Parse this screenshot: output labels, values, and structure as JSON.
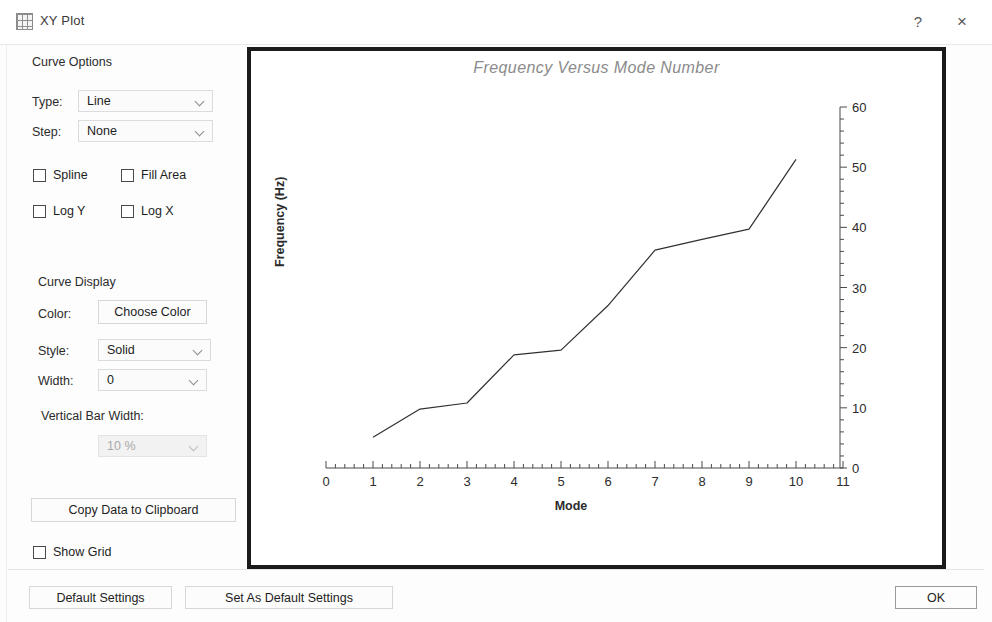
{
  "window": {
    "title": "XY Plot",
    "icon": "xy-plot-icon",
    "help_label": "?",
    "close_label": "×"
  },
  "curve_options": {
    "group_label": "Curve Options",
    "type_label": "Type:",
    "type_value": "Line",
    "type_options": [
      "Line",
      "Scatter",
      "Bar"
    ],
    "step_label": "Step:",
    "step_value": "None",
    "step_options": [
      "None",
      "Left",
      "Center",
      "Right"
    ],
    "spline_label": "Spline",
    "spline_checked": false,
    "fill_area_label": "Fill Area",
    "fill_area_checked": false,
    "log_y_label": "Log Y",
    "log_y_checked": false,
    "log_x_label": "Log X",
    "log_x_checked": false
  },
  "curve_display": {
    "group_label": "Curve Display",
    "color_label": "Color:",
    "choose_color_label": "Choose Color",
    "style_label": "Style:",
    "style_value": "Solid",
    "style_options": [
      "Solid",
      "Dash",
      "Dot",
      "DashDot"
    ],
    "width_label": "Width:",
    "width_value": "0",
    "width_options": [
      "0",
      "1",
      "2",
      "3"
    ],
    "vertical_bar_width_label": "Vertical Bar Width:",
    "vertical_bar_width_value": "10 %",
    "vertical_bar_width_enabled": false,
    "copy_data_label": "Copy Data to Clipboard",
    "show_grid_label": "Show Grid",
    "show_grid_checked": false
  },
  "footer": {
    "default_settings_label": "Default Settings",
    "set_as_default_settings_label": "Set As Default Settings",
    "ok_label": "OK"
  },
  "chart_data": {
    "type": "line",
    "title": "Frequency Versus Mode Number",
    "xlabel": "Mode",
    "ylabel": "Frequency (Hz)",
    "xlim": [
      0,
      11
    ],
    "ylim": [
      0,
      60
    ],
    "xticks": [
      0,
      1,
      2,
      3,
      4,
      5,
      6,
      7,
      8,
      9,
      10,
      11
    ],
    "yticks": [
      0,
      10,
      20,
      30,
      40,
      50,
      60
    ],
    "xtick_labels": [
      "0",
      "1",
      "2",
      "3",
      "4",
      "5",
      "6",
      "7",
      "8",
      "9",
      "10",
      "11"
    ],
    "ytick_labels": [
      "0",
      "10",
      "20",
      "30",
      "40",
      "50",
      "60"
    ],
    "x_minor_per_major": 5,
    "y_minor_per_major": 5,
    "grid": false,
    "legend": null,
    "y_axis_position": "right",
    "x": [
      1,
      2,
      3,
      4,
      5,
      6,
      7,
      8,
      9,
      10
    ],
    "values": [
      5.1,
      9.8,
      10.8,
      18.8,
      19.6,
      27.0,
      36.2,
      38.0,
      39.7,
      51.3
    ],
    "series": [
      {
        "name": "Frequency",
        "color": "#303030",
        "values": [
          5.1,
          9.8,
          10.8,
          18.8,
          19.6,
          27.0,
          36.2,
          38.0,
          39.7,
          51.3
        ]
      }
    ]
  }
}
